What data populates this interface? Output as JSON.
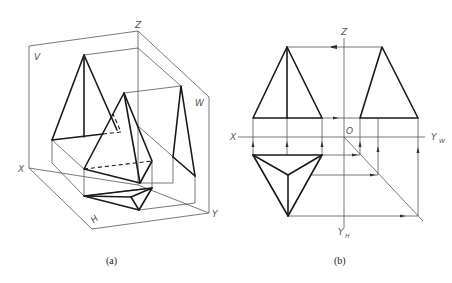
{
  "figure_a": {
    "caption": "(a)",
    "labels": {
      "z": "Z",
      "v": "V",
      "w": "W",
      "x": "X",
      "h": "H",
      "y": "Y"
    }
  },
  "figure_b": {
    "caption": "(b)",
    "labels": {
      "z": "Z",
      "x": "X",
      "o": "O",
      "yw_main": "Y",
      "yw_sub": "W",
      "yh_main": "Y",
      "yh_sub": "H"
    }
  }
}
